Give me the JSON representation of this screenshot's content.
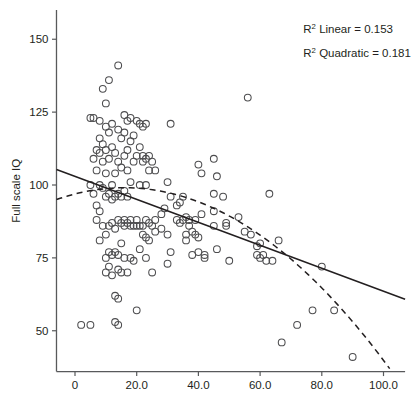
{
  "chart_data": {
    "type": "scatter",
    "title": "",
    "xlabel": "Time spent in orphanage (in months)",
    "ylabel": "Full scale IQ",
    "xlim": [
      -6,
      107
    ],
    "ylim": [
      36,
      160
    ],
    "grid": false,
    "legend_position": "none",
    "xticks": [
      0,
      20,
      40,
      60,
      80,
      100
    ],
    "xtick_labels": [
      "0",
      "20.0",
      "40.0",
      "60.0",
      "80.0",
      "100.0"
    ],
    "yticks": [
      50,
      75,
      100,
      125,
      150
    ],
    "ytick_labels": [
      "50",
      "75",
      "100",
      "125",
      "150"
    ],
    "marker": "open-circle",
    "annotations": [
      {
        "id": "r2-linear",
        "text": "R² Linear = 0.153",
        "value": 0.153,
        "x": 74,
        "y": 152
      },
      {
        "id": "r2-quadratic",
        "text": "R² Quadratic = 0.181",
        "value": 0.181,
        "x": 74,
        "y": 144
      }
    ],
    "series": [
      {
        "name": "Observations",
        "type": "scatter",
        "points": [
          [
            2,
            52
          ],
          [
            5,
            52
          ],
          [
            5,
            100
          ],
          [
            5,
            123
          ],
          [
            6,
            123
          ],
          [
            6,
            109
          ],
          [
            6,
            97
          ],
          [
            7,
            112
          ],
          [
            7,
            105
          ],
          [
            7,
            93
          ],
          [
            7,
            88
          ],
          [
            8,
            122
          ],
          [
            8,
            116
          ],
          [
            8,
            111
          ],
          [
            8,
            100
          ],
          [
            8,
            91
          ],
          [
            8,
            81
          ],
          [
            9,
            133
          ],
          [
            9,
            114
          ],
          [
            9,
            108
          ],
          [
            9,
            99
          ],
          [
            9,
            86
          ],
          [
            10,
            128
          ],
          [
            10,
            120
          ],
          [
            10,
            112
          ],
          [
            10,
            104
          ],
          [
            10,
            96
          ],
          [
            10,
            83
          ],
          [
            10,
            75
          ],
          [
            10,
            70
          ],
          [
            11,
            136
          ],
          [
            11,
            118
          ],
          [
            11,
            109
          ],
          [
            11,
            97
          ],
          [
            11,
            86
          ],
          [
            11,
            77
          ],
          [
            11,
            72
          ],
          [
            12,
            121
          ],
          [
            12,
            113
          ],
          [
            12,
            100
          ],
          [
            12,
            95
          ],
          [
            12,
            87
          ],
          [
            12,
            76
          ],
          [
            12,
            69
          ],
          [
            13,
            111
          ],
          [
            13,
            104
          ],
          [
            13,
            96
          ],
          [
            13,
            85
          ],
          [
            13,
            77
          ],
          [
            13,
            62
          ],
          [
            13,
            53
          ],
          [
            14,
            141
          ],
          [
            14,
            119
          ],
          [
            14,
            108
          ],
          [
            14,
            97
          ],
          [
            14,
            88
          ],
          [
            14,
            76
          ],
          [
            14,
            71
          ],
          [
            14,
            61
          ],
          [
            14,
            52
          ],
          [
            15,
            116
          ],
          [
            15,
            106
          ],
          [
            15,
            96
          ],
          [
            15,
            87
          ],
          [
            15,
            80
          ],
          [
            15,
            70
          ],
          [
            16,
            124
          ],
          [
            16,
            118
          ],
          [
            16,
            110
          ],
          [
            16,
            98
          ],
          [
            16,
            88
          ],
          [
            16,
            86
          ],
          [
            16,
            75
          ],
          [
            17,
            122
          ],
          [
            17,
            112
          ],
          [
            17,
            105
          ],
          [
            17,
            96
          ],
          [
            17,
            87
          ],
          [
            17,
            70
          ],
          [
            18,
            123
          ],
          [
            18,
            115
          ],
          [
            18,
            101
          ],
          [
            18,
            88
          ],
          [
            18,
            86
          ],
          [
            18,
            75
          ],
          [
            19,
            117
          ],
          [
            19,
            108
          ],
          [
            19,
            86
          ],
          [
            19,
            74
          ],
          [
            20,
            122
          ],
          [
            20,
            110
          ],
          [
            20,
            88
          ],
          [
            20,
            86
          ],
          [
            20,
            57
          ],
          [
            21,
            121
          ],
          [
            21,
            113
          ],
          [
            21,
            100
          ],
          [
            21,
            86
          ],
          [
            21,
            78
          ],
          [
            22,
            120
          ],
          [
            22,
            110
          ],
          [
            22,
            108
          ],
          [
            22,
            86
          ],
          [
            22,
            83
          ],
          [
            23,
            121
          ],
          [
            23,
            109
          ],
          [
            23,
            100
          ],
          [
            23,
            88
          ],
          [
            23,
            82
          ],
          [
            23,
            75
          ],
          [
            24,
            110
          ],
          [
            24,
            105
          ],
          [
            24,
            87
          ],
          [
            24,
            81
          ],
          [
            25,
            108
          ],
          [
            25,
            86
          ],
          [
            25,
            70
          ],
          [
            26,
            105
          ],
          [
            26,
            88
          ],
          [
            26,
            84
          ],
          [
            28,
            90
          ],
          [
            28,
            85
          ],
          [
            29,
            92
          ],
          [
            30,
            101
          ],
          [
            30,
            83
          ],
          [
            30,
            73
          ],
          [
            31,
            121
          ],
          [
            31,
            96
          ],
          [
            31,
            77
          ],
          [
            33,
            93
          ],
          [
            33,
            88
          ],
          [
            34,
            94
          ],
          [
            34,
            87
          ],
          [
            35,
            96
          ],
          [
            35,
            88
          ],
          [
            36,
            89
          ],
          [
            36,
            83
          ],
          [
            36,
            81
          ],
          [
            37,
            88
          ],
          [
            37,
            86
          ],
          [
            38,
            84
          ],
          [
            38,
            76
          ],
          [
            39,
            88
          ],
          [
            39,
            83
          ],
          [
            40,
            107
          ],
          [
            40,
            82
          ],
          [
            40,
            77
          ],
          [
            41,
            104
          ],
          [
            41,
            90
          ],
          [
            42,
            76
          ],
          [
            42,
            75
          ],
          [
            45,
            109
          ],
          [
            45,
            97
          ],
          [
            45,
            91
          ],
          [
            45,
            86
          ],
          [
            46,
            103
          ],
          [
            46,
            78
          ],
          [
            48,
            96
          ],
          [
            49,
            87
          ],
          [
            49,
            86
          ],
          [
            50,
            74
          ],
          [
            53,
            89
          ],
          [
            55,
            84
          ],
          [
            56,
            130
          ],
          [
            57,
            83
          ],
          [
            59,
            79
          ],
          [
            59,
            76
          ],
          [
            60,
            80
          ],
          [
            60,
            75
          ],
          [
            61,
            76
          ],
          [
            62,
            74
          ],
          [
            63,
            97
          ],
          [
            64,
            74
          ],
          [
            66,
            81
          ],
          [
            67,
            46
          ],
          [
            72,
            52
          ],
          [
            77,
            57
          ],
          [
            80,
            72
          ],
          [
            84,
            57
          ],
          [
            90,
            41
          ]
        ]
      },
      {
        "name": "Linear fit",
        "type": "line",
        "style": "solid",
        "equation": "y = 101.3 - 0.43x",
        "endpoints": [
          [
            -6,
            105.3
          ],
          [
            107,
            60.8
          ]
        ]
      },
      {
        "name": "Quadratic fit",
        "type": "line",
        "style": "dashed",
        "equation": "y = 94.9 + 0.30x - 0.0095x²",
        "vertex_x": 16,
        "endpoints": [
          [
            -6,
            95.0
          ],
          [
            102,
            37.0
          ]
        ]
      }
    ]
  }
}
